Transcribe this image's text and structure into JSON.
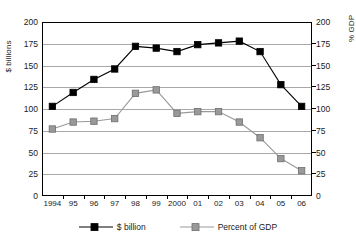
{
  "chart_data": {
    "type": "line",
    "title": "",
    "xlabel": "",
    "categories": [
      "1994",
      "95",
      "96",
      "97",
      "98",
      "99",
      "2000",
      "01",
      "02",
      "03",
      "04",
      "05",
      "06"
    ],
    "series": [
      {
        "name": "$ billion",
        "axis": "left",
        "color": "#000000",
        "marker": "square",
        "values": [
          103,
          119,
          134,
          146,
          172,
          170,
          166,
          174,
          176,
          178,
          166,
          128,
          103
        ]
      },
      {
        "name": "Percent of GDP",
        "axis": "right",
        "color": "#999999",
        "marker": "square",
        "values": [
          77,
          85,
          86,
          89,
          118,
          122,
          95,
          97,
          97,
          85,
          67,
          43,
          29
        ]
      }
    ],
    "y_left": {
      "label": "$ billions",
      "ticks": [
        200,
        175,
        150,
        125,
        100,
        75,
        50,
        25,
        0
      ],
      "ylim": [
        0,
        200
      ]
    },
    "y_right": {
      "label": "% GDP",
      "ticks": [
        200,
        175,
        150,
        125,
        100,
        75,
        50,
        25,
        0
      ],
      "ylim": [
        0,
        200
      ]
    },
    "grid": true,
    "legend_position": "bottom",
    "legend": [
      {
        "label": "$ billion",
        "color": "#000000"
      },
      {
        "label": "Percent of GDP",
        "color": "#999999"
      }
    ]
  }
}
